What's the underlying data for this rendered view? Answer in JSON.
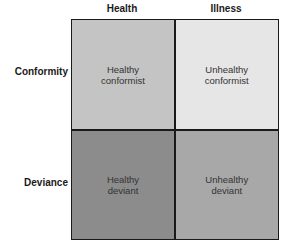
{
  "columns": [
    "Health",
    "Illness"
  ],
  "rows": [
    "Conformity",
    "Deviance"
  ],
  "cells": [
    {
      "line1": "Healthy",
      "line2": "conformist",
      "color": "#c4c4c4"
    },
    {
      "line1": "Unhealthy",
      "line2": "conformist",
      "color": "#e6e6e6"
    },
    {
      "line1": "Healthy",
      "line2": "deviant",
      "color": "#8c8c8c"
    },
    {
      "line1": "Unhealthy",
      "line2": "deviant",
      "color": "#a8a8a8"
    }
  ]
}
